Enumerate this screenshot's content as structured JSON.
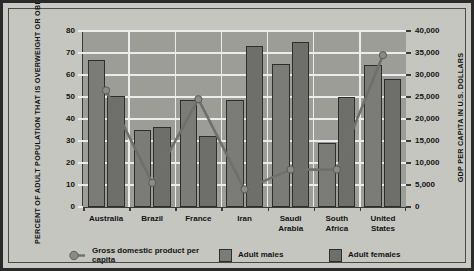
{
  "axes": {
    "left_title": "PERCENT OF ADULT POPULATION THAT IS OVERWEIGHT OR OBESE",
    "right_title": "GDP PER CAPITA IN U.S. DOLLARS",
    "left_ticks": [
      "0",
      "10",
      "20",
      "30",
      "40",
      "50",
      "60",
      "70",
      "80"
    ],
    "right_ticks": [
      "0",
      "5,000",
      "10,000",
      "15,000",
      "20,000",
      "25,000",
      "30,000",
      "35,000",
      "40,000"
    ]
  },
  "legend": {
    "gdp": "Gross domestic product per capita",
    "males": "Adult males",
    "females": "Adult females"
  },
  "colors": {
    "male_bar": "#7b7b77",
    "female_bar": "#6e6e6a",
    "line": "#6f6f6b",
    "plot_bg": "#9d9d98",
    "page_bg": "#c6c6c1",
    "grid": "#ececed"
  },
  "chart_data": {
    "type": "bar",
    "title": "",
    "categories": [
      "Australia",
      "Brazil",
      "France",
      "Iran",
      "Saudi Arabia",
      "South Africa",
      "United States"
    ],
    "series": [
      {
        "name": "Adult males",
        "axis": "left",
        "values": [
          67,
          35,
          48.5,
          48.5,
          65,
          29,
          64.5
        ]
      },
      {
        "name": "Adult females",
        "axis": "left",
        "values": [
          50.5,
          36.5,
          32.5,
          73,
          75,
          50,
          58
        ]
      },
      {
        "name": "Gross domestic product per capita",
        "axis": "right",
        "values": [
          26500,
          5500,
          24500,
          4000,
          8500,
          8500,
          34500
        ]
      }
    ],
    "xlabel": "",
    "ylabel": "PERCENT OF ADULT POPULATION THAT IS OVERWEIGHT OR OBESE",
    "ylabel_right": "GDP PER CAPITA IN U.S. DOLLARS",
    "ylim": [
      0,
      80
    ],
    "ylim_right": [
      0,
      40000
    ],
    "grid": true,
    "legend_position": "bottom"
  }
}
